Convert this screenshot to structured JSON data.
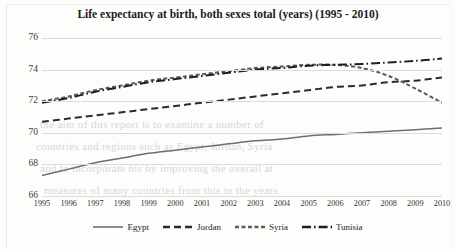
{
  "chart_data": {
    "type": "line",
    "title": "Life expectancy at birth, both sexes total (years) (1995 - 2010)",
    "xlabel": "",
    "ylabel": "",
    "grid": true,
    "legend_position": "bottom",
    "ylim": [
      66,
      76
    ],
    "yticks": [
      66,
      68,
      70,
      72,
      74,
      76
    ],
    "categories": [
      "1995",
      "1996",
      "1997",
      "1998",
      "1999",
      "2000",
      "2001",
      "2002",
      "2003",
      "2004",
      "2005",
      "2006",
      "2007",
      "2008",
      "2009",
      "2010"
    ],
    "series": [
      {
        "name": "Egypt",
        "style": "solid",
        "color": "#6e6e6e",
        "values": [
          67.3,
          67.7,
          68.1,
          68.4,
          68.7,
          68.9,
          69.1,
          69.3,
          69.5,
          69.6,
          69.8,
          69.9,
          70.0,
          70.1,
          70.2,
          70.3
        ]
      },
      {
        "name": "Jordan",
        "style": "dashed",
        "color": "#2b2b2b",
        "values": [
          70.7,
          70.9,
          71.1,
          71.3,
          71.5,
          71.7,
          71.9,
          72.1,
          72.3,
          72.5,
          72.7,
          72.9,
          73.0,
          73.2,
          73.3,
          73.5
        ]
      },
      {
        "name": "Syria",
        "style": "dotted",
        "color": "#5a5a5a",
        "values": [
          72.0,
          72.3,
          72.7,
          73.0,
          73.3,
          73.5,
          73.7,
          73.9,
          74.1,
          74.2,
          74.3,
          74.3,
          74.1,
          73.6,
          72.8,
          71.9
        ]
      },
      {
        "name": "Tunisia",
        "style": "dashdot",
        "color": "#1f1f1f",
        "values": [
          71.9,
          72.2,
          72.6,
          72.9,
          73.2,
          73.4,
          73.6,
          73.8,
          74.0,
          74.1,
          74.25,
          74.3,
          74.35,
          74.45,
          74.55,
          74.7
        ]
      }
    ]
  },
  "legend": {
    "items": [
      {
        "label": "Egypt"
      },
      {
        "label": "Jordan"
      },
      {
        "label": "Syria"
      },
      {
        "label": "Tunisia"
      }
    ]
  },
  "scan_bleed": {
    "lines": [
      "the aim of this report is to examine a number of",
      "countries and regions such as Egypt, Jordan, Syria",
      "and to incorporate his by improving the overall at",
      "measures of many countries from this in the years"
    ]
  }
}
